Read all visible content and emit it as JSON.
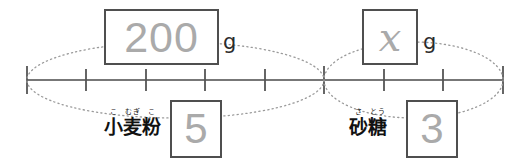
{
  "diagram": {
    "type": "double-number-line",
    "colors": {
      "box_border": "#4f4f4f",
      "box_value_text": "#aaaaaa",
      "number_line": "#777777",
      "tick": "#555555",
      "ellipse_dotted": "#999999",
      "label_text": "#111111",
      "background": "#ffffff"
    }
  },
  "number_line": {
    "y": 80,
    "x_start": 27,
    "x_end": 503,
    "tick_count": 9,
    "tick_positions": [
      27,
      86,
      146,
      205,
      265,
      324,
      384,
      443,
      503
    ],
    "tick_half_height": 11,
    "end_tick_half_height": 14
  },
  "braces": [
    {
      "name": "flour-span",
      "x_left": 27,
      "x_right": 324,
      "style": "dotted-ellipse"
    },
    {
      "name": "sugar-span",
      "x_left": 324,
      "x_right": 503,
      "style": "dotted-ellipse"
    }
  ],
  "quantities": {
    "flour": {
      "amount_value": "200",
      "unit": "g",
      "parts_value": "5",
      "name_base_1": "小",
      "name_reading_1": "こ",
      "name_base_2": "麦",
      "name_reading_2": "むぎ",
      "name_base_3": "粉",
      "name_reading_3": "こ",
      "name_full": "小麦粉",
      "name_full_reading": "こむぎこ"
    },
    "sugar": {
      "amount_value": "x",
      "unit": "g",
      "parts_value": "3",
      "name_base_1": "砂",
      "name_reading_1": "さ",
      "name_base_2": "糖",
      "name_reading_2": "とう",
      "name_full": "砂糖",
      "name_full_reading": "さとう"
    }
  }
}
